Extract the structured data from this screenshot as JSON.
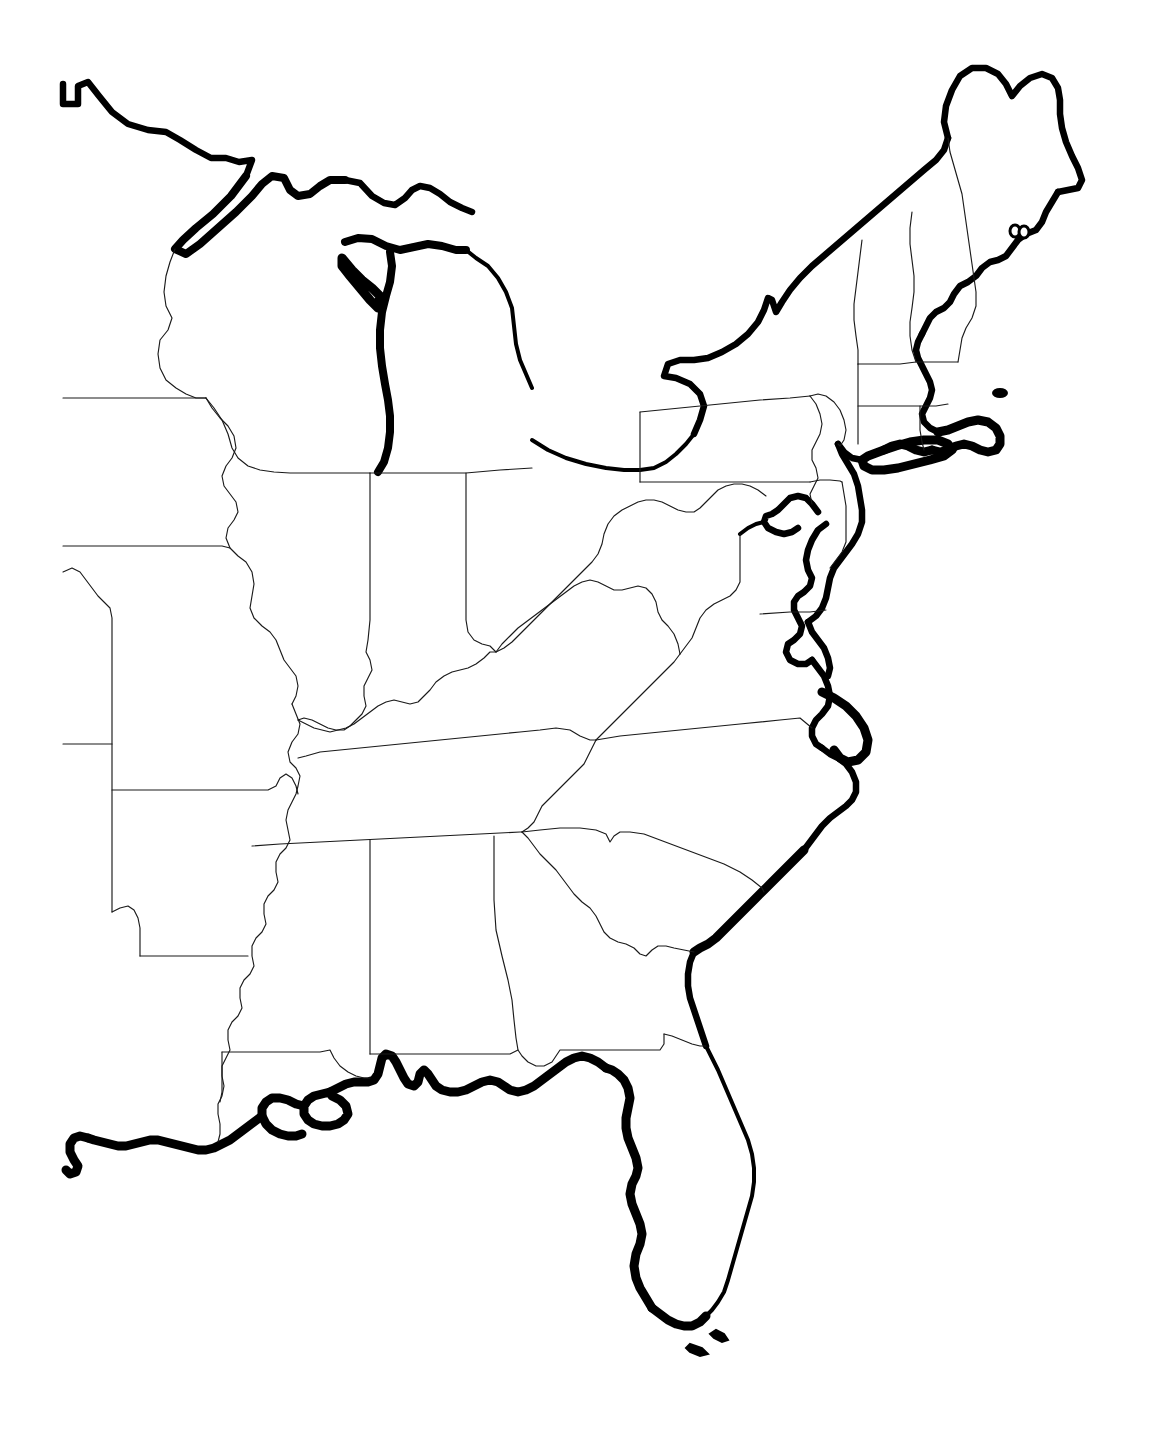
{
  "document": {
    "title": "Eastern United States Outline Map",
    "type": "blank-outline-map",
    "region": "Eastern United States",
    "background_color": "#ffffff",
    "border_color": "#1a1a1a",
    "coastline_color": "#000000",
    "width": 1151,
    "height": 1437,
    "has_labels": false,
    "has_legend": false,
    "has_title_text": false,
    "has_scale_bar": false,
    "has_compass": false
  },
  "map": {
    "style": {
      "interior_border_weight": "thin",
      "coastline_weight": "heavy",
      "fill": "none",
      "projection_look": "conic"
    },
    "features": {
      "coastlines": [
        "atlantic-coast",
        "gulf-coast",
        "great-lakes-shore",
        "chesapeake-bay",
        "long-island-sound",
        "cape-cod",
        "outer-banks",
        "florida-keys"
      ],
      "great_lakes": [
        "lake-superior",
        "lake-michigan",
        "lake-huron",
        "lake-erie",
        "lake-ontario"
      ]
    },
    "states_depicted": [
      "Minnesota",
      "Wisconsin",
      "Michigan",
      "Iowa",
      "Illinois",
      "Indiana",
      "Ohio",
      "Missouri",
      "Kentucky",
      "West Virginia",
      "Virginia",
      "Pennsylvania",
      "New York",
      "Vermont",
      "New Hampshire",
      "Maine",
      "Massachusetts",
      "Rhode Island",
      "Connecticut",
      "New Jersey",
      "Delaware",
      "Maryland",
      "North Carolina",
      "South Carolina",
      "Tennessee",
      "Arkansas",
      "Louisiana",
      "Mississippi",
      "Alabama",
      "Georgia",
      "Florida"
    ],
    "partial_states_at_edge": [
      "Minnesota",
      "Iowa",
      "Missouri",
      "Arkansas",
      "Louisiana"
    ]
  }
}
